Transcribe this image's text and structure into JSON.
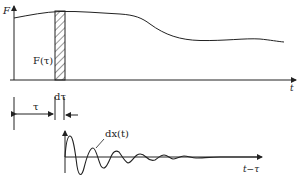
{
  "diagram": {
    "top_plot": {
      "y_axis_label": "F",
      "x_axis_label": "t",
      "strip_label": "F(τ)",
      "curve_description": "slowly varying force F(t)"
    },
    "dimension_labels": {
      "tau": "τ",
      "dtau": "dτ"
    },
    "bottom_plot": {
      "response_label": "dx(t)",
      "x_axis_label": "t−τ",
      "curve_description": "damped oscillatory response to impulse F(τ)dτ"
    },
    "colors": {
      "ink": "#222222",
      "background": "#ffffff"
    }
  }
}
